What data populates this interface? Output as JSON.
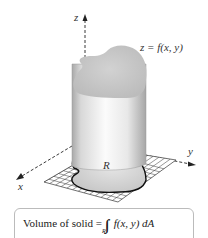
{
  "figure": {
    "axes": {
      "z_label": "z",
      "y_label": "y",
      "x_label": "x"
    },
    "surface_label": "z = f(x, y)",
    "region_label": "R",
    "colors": {
      "surface_top": "#c8c8c8",
      "cylinder_light": "#f4f4f4",
      "cylinder_dark": "#b8b8b8",
      "grid_line": "#333333",
      "region_fill": "#d6d6d6",
      "region_outline": "#111111"
    }
  },
  "formula": {
    "prefix": "Volume of solid = ",
    "integral": "∫∫",
    "subscript": "R",
    "integrand": "f(x, y) dA"
  }
}
